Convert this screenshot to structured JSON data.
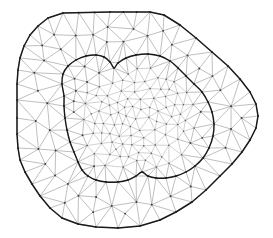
{
  "figure": {
    "background_color": "#ffffff",
    "width": 273,
    "height": 238
  },
  "chart_data": {
    "type": "diagram",
    "subtype": "finite-element-triangular-mesh",
    "xlabel": "",
    "ylabel": "",
    "xlim": [
      0,
      273
    ],
    "ylim": [
      0,
      238
    ],
    "grid": false,
    "legend": "none",
    "annotations": [],
    "regions": [
      {
        "name": "outer-domain",
        "description": "Coarse mesh region between outer polygon boundary and inner interface curve",
        "mesh_density": "coarse"
      },
      {
        "name": "inner-subdomain",
        "description": "Refined mesh region enclosed by the inner interface curve",
        "mesh_density": "fine"
      }
    ],
    "styles": {
      "outer_boundary_color": "#1a1a1a",
      "inner_interface_color": "#1a1a1a",
      "mesh_edge_color": "#8a8a8a",
      "mesh_node_color": "#3c3c3c",
      "outer_boundary_width": 1.5,
      "inner_interface_width": 1.4,
      "mesh_edge_width": 0.55
    },
    "outer_boundary": [
      [
        63,
        13
      ],
      [
        110,
        12
      ],
      [
        150,
        12
      ],
      [
        164,
        15
      ],
      [
        180,
        25
      ],
      [
        196,
        38
      ],
      [
        212,
        52
      ],
      [
        228,
        66
      ],
      [
        240,
        79
      ],
      [
        250,
        92
      ],
      [
        256,
        104
      ],
      [
        258,
        116
      ],
      [
        256,
        128
      ],
      [
        250,
        140
      ],
      [
        242,
        152
      ],
      [
        232,
        164
      ],
      [
        220,
        176
      ],
      [
        206,
        190
      ],
      [
        192,
        202
      ],
      [
        176,
        212
      ],
      [
        160,
        220
      ],
      [
        140,
        226
      ],
      [
        118,
        228
      ],
      [
        96,
        227
      ],
      [
        78,
        224
      ],
      [
        62,
        218
      ],
      [
        50,
        208
      ],
      [
        40,
        196
      ],
      [
        32,
        184
      ],
      [
        25,
        172
      ],
      [
        20,
        160
      ],
      [
        18,
        148
      ],
      [
        17,
        134
      ],
      [
        17,
        118
      ],
      [
        17,
        100
      ],
      [
        17,
        84
      ],
      [
        18,
        70
      ],
      [
        20,
        58
      ],
      [
        24,
        46
      ],
      [
        30,
        35
      ],
      [
        38,
        26
      ],
      [
        48,
        18
      ],
      [
        63,
        13
      ]
    ],
    "inner_interface": [
      [
        64,
        96
      ],
      [
        62,
        84
      ],
      [
        63,
        74
      ],
      [
        68,
        66
      ],
      [
        76,
        60
      ],
      [
        86,
        56
      ],
      [
        96,
        55
      ],
      [
        104,
        57
      ],
      [
        110,
        62
      ],
      [
        114,
        68
      ],
      [
        118,
        63
      ],
      [
        126,
        58
      ],
      [
        136,
        55
      ],
      [
        148,
        54
      ],
      [
        160,
        56
      ],
      [
        170,
        61
      ],
      [
        178,
        68
      ],
      [
        186,
        76
      ],
      [
        194,
        84
      ],
      [
        202,
        92
      ],
      [
        208,
        102
      ],
      [
        212,
        112
      ],
      [
        214,
        124
      ],
      [
        213,
        136
      ],
      [
        209,
        148
      ],
      [
        203,
        158
      ],
      [
        195,
        166
      ],
      [
        186,
        172
      ],
      [
        176,
        176
      ],
      [
        166,
        178
      ],
      [
        156,
        178
      ],
      [
        148,
        176
      ],
      [
        142,
        172
      ],
      [
        136,
        176
      ],
      [
        128,
        180
      ],
      [
        118,
        182
      ],
      [
        106,
        182
      ],
      [
        96,
        180
      ],
      [
        88,
        176
      ],
      [
        82,
        170
      ],
      [
        78,
        162
      ],
      [
        74,
        152
      ],
      [
        70,
        142
      ],
      [
        67,
        130
      ],
      [
        65,
        118
      ],
      [
        64,
        106
      ],
      [
        64,
        96
      ]
    ],
    "mesh_nodes_count": 212,
    "mesh_triangles_count": 376,
    "edge_seed": 20250131
  }
}
